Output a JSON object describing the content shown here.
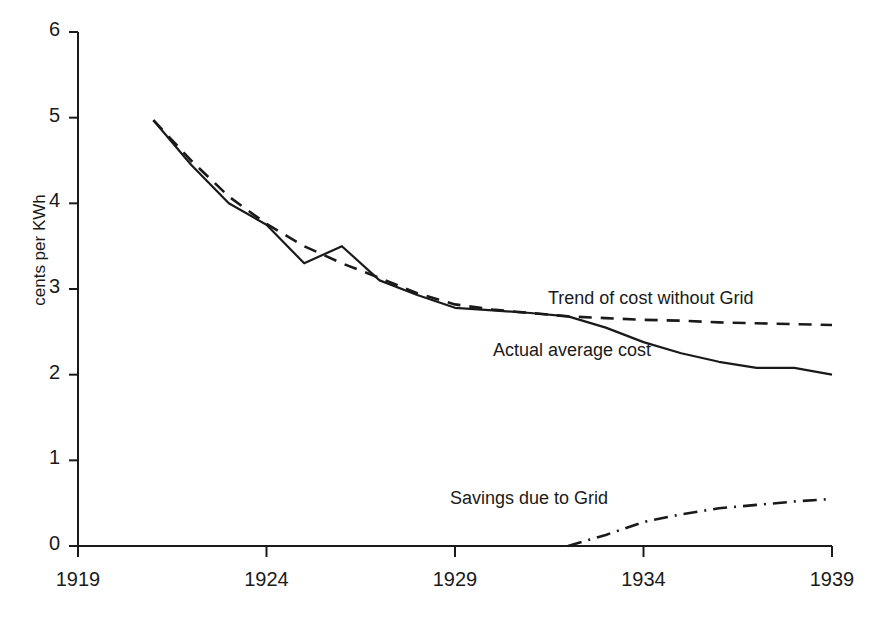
{
  "chart_data": {
    "type": "line",
    "title": "",
    "xlabel": "",
    "ylabel": "cents per KWh",
    "xlim": [
      1919,
      1939
    ],
    "ylim": [
      0,
      6
    ],
    "grid": false,
    "legend_position": "inline-annotations",
    "x_ticks": [
      "1919",
      "1924",
      "1929",
      "1934",
      "1939"
    ],
    "y_ticks": [
      "0",
      "1",
      "2",
      "3",
      "4",
      "5",
      "6"
    ],
    "series": [
      {
        "name": "Actual average cost",
        "style": "solid",
        "annotation": "Actual average cost",
        "x": [
          1921,
          1922,
          1923,
          1924,
          1925,
          1926,
          1927,
          1928,
          1929,
          1930,
          1931,
          1932,
          1933,
          1934,
          1935,
          1936,
          1937,
          1938,
          1939
        ],
        "values": [
          4.97,
          4.45,
          4.0,
          3.75,
          3.3,
          3.5,
          3.1,
          2.93,
          2.78,
          2.75,
          2.72,
          2.68,
          2.55,
          2.38,
          2.25,
          2.15,
          2.08,
          2.08,
          2.0
        ]
      },
      {
        "name": "Trend of cost without Grid",
        "style": "dashed",
        "annotation": "Trend of cost without Grid",
        "x": [
          1921,
          1922,
          1923,
          1924,
          1925,
          1926,
          1927,
          1928,
          1929,
          1930,
          1931,
          1932,
          1933,
          1934,
          1935,
          1936,
          1937,
          1938,
          1939
        ],
        "values": [
          4.97,
          4.5,
          4.08,
          3.76,
          3.5,
          3.3,
          3.13,
          2.95,
          2.82,
          2.76,
          2.72,
          2.68,
          2.66,
          2.64,
          2.63,
          2.61,
          2.6,
          2.59,
          2.58
        ]
      },
      {
        "name": "Savings due to Grid",
        "style": "dash-dot",
        "annotation": "Savings due to Grid",
        "x": [
          1932,
          1933,
          1934,
          1935,
          1936,
          1937,
          1938,
          1939
        ],
        "values": [
          0.0,
          0.13,
          0.28,
          0.37,
          0.44,
          0.48,
          0.52,
          0.55
        ]
      }
    ],
    "colors": {
      "line": "#1a1a1a",
      "axis": "#1a1a1a",
      "background": "#ffffff"
    }
  },
  "axes": {
    "y_title": "cents per KWh"
  },
  "annotations": {
    "trend": "Trend of cost without Grid",
    "actual": "Actual average cost",
    "savings": "Savings due to Grid"
  }
}
